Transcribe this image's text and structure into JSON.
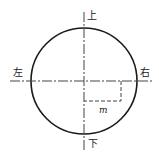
{
  "diagram": {
    "labels": {
      "top": "上",
      "bottom": "下",
      "left": "左",
      "right": "右",
      "offset": "m"
    },
    "colors": {
      "stroke": "#1a1a1a",
      "axis": "#444444",
      "text": "#222222"
    },
    "geometry": {
      "circle": {
        "cx": 84,
        "cy": 81,
        "r": 53
      },
      "vertical_axis": {
        "x": 84,
        "y1": 12,
        "y2": 151
      },
      "horizontal_axis": {
        "y": 81,
        "x1": 10,
        "x2": 152
      },
      "offset_rect": {
        "x1": 84,
        "y1": 81,
        "x2": 121,
        "y2": 101
      }
    }
  }
}
